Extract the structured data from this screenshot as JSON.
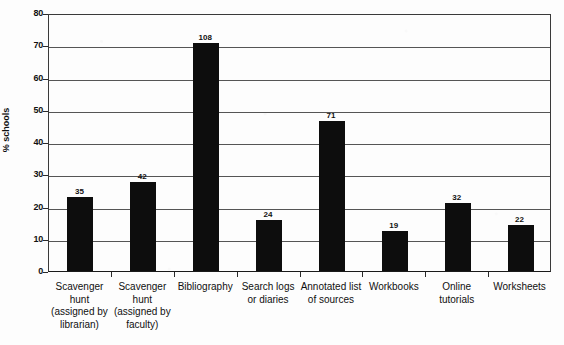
{
  "chart_data": {
    "type": "bar",
    "title": "",
    "subtitle": "",
    "xlabel": "",
    "ylabel": "% schools",
    "ylim": [
      0,
      80
    ],
    "ytick_step": 10,
    "yticks": [
      "0",
      "10",
      "20",
      "30",
      "40",
      "50",
      "60",
      "70",
      "80"
    ],
    "grid": true,
    "legend": "none",
    "bar_color": "#0d0d0d",
    "categories": [
      "Scavenger\nhunt\n(assigned by\nlibrarian)",
      "Scavenger\nhunt\n(assigned by\nfaculty)",
      "Bibliography",
      "Search logs\nor diaries",
      "Annotated list\nof sources",
      "Workbooks",
      "Online\ntutorials",
      "Worksheets"
    ],
    "values": [
      22.9,
      27.5,
      70.7,
      15.7,
      46.5,
      12.4,
      21.0,
      14.4
    ],
    "data_labels": [
      "35",
      "42",
      "108",
      "24",
      "71",
      "19",
      "32",
      "22"
    ],
    "data_label_meaning": "count of schools shown above each bar",
    "series": [
      {
        "name": "% schools",
        "values": [
          22.9,
          27.5,
          70.7,
          15.7,
          46.5,
          12.4,
          21.0,
          14.4
        ],
        "counts": [
          35,
          42,
          108,
          24,
          71,
          19,
          32,
          22
        ]
      }
    ]
  }
}
